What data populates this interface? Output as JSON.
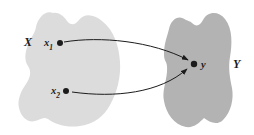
{
  "figure": {
    "sets": {
      "domain": {
        "label": "X",
        "fill": "#dcdcdc"
      },
      "codomain": {
        "label": "Y",
        "fill": "#b3b3b3"
      }
    },
    "points": {
      "x1": {
        "base": "x",
        "subscript": "1"
      },
      "x2": {
        "base": "x",
        "subscript": "2"
      },
      "y": {
        "label": "y"
      }
    },
    "colors": {
      "ink": "#1c1c1c",
      "background": "#ffffff"
    }
  }
}
